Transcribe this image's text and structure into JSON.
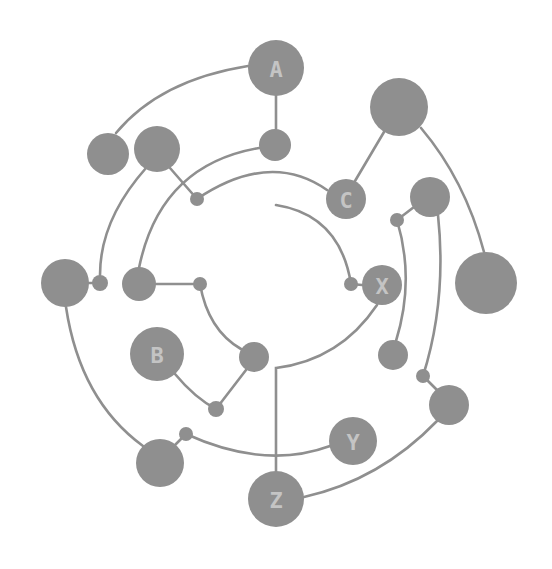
{
  "diagram": {
    "title": "",
    "colors": {
      "node": "#8f8f8f",
      "edge": "#8f8f8f",
      "label": "#c4c4c4",
      "background": "#ffffff"
    },
    "nodes": [
      {
        "id": "A",
        "label": "A",
        "x": 276,
        "y": 68,
        "r": 28
      },
      {
        "id": "a_small",
        "label": "",
        "x": 275,
        "y": 145,
        "r": 16
      },
      {
        "id": "tl1",
        "label": "",
        "x": 108,
        "y": 154,
        "r": 21
      },
      {
        "id": "tl2",
        "label": "",
        "x": 157,
        "y": 149,
        "r": 23
      },
      {
        "id": "dot_tl",
        "label": "",
        "x": 197,
        "y": 199,
        "r": 7
      },
      {
        "id": "big_tr",
        "label": "",
        "x": 399,
        "y": 107,
        "r": 29
      },
      {
        "id": "C",
        "label": "C",
        "x": 346,
        "y": 199,
        "r": 20
      },
      {
        "id": "r_mid",
        "label": "",
        "x": 430,
        "y": 197,
        "r": 20
      },
      {
        "id": "dot_r",
        "label": "",
        "x": 397,
        "y": 220,
        "r": 7
      },
      {
        "id": "big_r",
        "label": "",
        "x": 486,
        "y": 283,
        "r": 31
      },
      {
        "id": "X",
        "label": "X",
        "x": 382,
        "y": 285,
        "r": 20
      },
      {
        "id": "dot_x",
        "label": "",
        "x": 351,
        "y": 284,
        "r": 7
      },
      {
        "id": "left_big",
        "label": "",
        "x": 65,
        "y": 283,
        "r": 24
      },
      {
        "id": "dot_l",
        "label": "",
        "x": 100,
        "y": 283,
        "r": 8
      },
      {
        "id": "l_mid",
        "label": "",
        "x": 139,
        "y": 284,
        "r": 17
      },
      {
        "id": "dot_lm",
        "label": "",
        "x": 200,
        "y": 284,
        "r": 7
      },
      {
        "id": "r_low",
        "label": "",
        "x": 393,
        "y": 355,
        "r": 15
      },
      {
        "id": "B",
        "label": "B",
        "x": 157,
        "y": 354,
        "r": 27
      },
      {
        "id": "c_mid",
        "label": "",
        "x": 254,
        "y": 357,
        "r": 15
      },
      {
        "id": "dot_b",
        "label": "",
        "x": 216,
        "y": 409,
        "r": 8
      },
      {
        "id": "dot_rl",
        "label": "",
        "x": 423,
        "y": 376,
        "r": 7
      },
      {
        "id": "r_bot",
        "label": "",
        "x": 449,
        "y": 405,
        "r": 20
      },
      {
        "id": "dot_bl",
        "label": "",
        "x": 186,
        "y": 434,
        "r": 7
      },
      {
        "id": "bl_big",
        "label": "",
        "x": 160,
        "y": 463,
        "r": 24
      },
      {
        "id": "Y",
        "label": "Y",
        "x": 353,
        "y": 441,
        "r": 24
      },
      {
        "id": "Z",
        "label": "Z",
        "x": 276,
        "y": 499,
        "r": 28
      }
    ],
    "edges": [
      {
        "id": "A-tl1",
        "d": "M 248 66 Q 160 80 116 133"
      },
      {
        "id": "A-a_small",
        "d": "M 276 96 L 276 129"
      },
      {
        "id": "a_small-l_mid",
        "d": "M 259 148 Q 160 165 139 268"
      },
      {
        "id": "tl2-dot_tl",
        "d": "M 170 168 L 197 199"
      },
      {
        "id": "dot_tl-C",
        "d": "M 197 199 Q 270 150 327 190"
      },
      {
        "id": "tl2-dot_l",
        "d": "M 146 168 Q 100 220 100 275"
      },
      {
        "id": "big_tr-C",
        "d": "M 384 132 L 355 181"
      },
      {
        "id": "big_tr-big_r",
        "d": "M 421 128 Q 465 180 484 252"
      },
      {
        "id": "r_mid-dot_r",
        "d": "M 414 207 L 397 220"
      },
      {
        "id": "dot_r-r_low",
        "d": "M 397 220 Q 415 280 396 341"
      },
      {
        "id": "r_mid-dot_rl",
        "d": "M 438 215 Q 447 300 423 376"
      },
      {
        "id": "dot_rl-r_bot",
        "d": "M 423 376 L 437 390"
      },
      {
        "id": "center-X",
        "d": "M 276 205 Q 340 215 351 284"
      },
      {
        "id": "dot_x-X",
        "d": "M 351 284 L 362 285"
      },
      {
        "id": "X-Z",
        "d": "M 377 305 Q 340 360 276 368 L 276 471"
      },
      {
        "id": "left_big-bl_big",
        "d": "M 66 307 Q 80 400 143 446"
      },
      {
        "id": "left_big-dot_l",
        "d": "M 89 283 L 100 283"
      },
      {
        "id": "l_mid-dot_lm",
        "d": "M 156 284 L 200 284"
      },
      {
        "id": "dot_lm-c_mid",
        "d": "M 200 284 Q 208 330 241 349"
      },
      {
        "id": "c_mid-dot_b",
        "d": "M 246 370 L 216 409"
      },
      {
        "id": "B-dot_b",
        "d": "M 175 374 Q 195 398 216 409"
      },
      {
        "id": "bl_big-dot_bl",
        "d": "M 174 446 L 186 434"
      },
      {
        "id": "dot_bl-Y",
        "d": "M 186 434 Q 265 470 330 446"
      },
      {
        "id": "r_bot-Z",
        "d": "M 437 421 Q 380 480 304 497"
      }
    ]
  }
}
